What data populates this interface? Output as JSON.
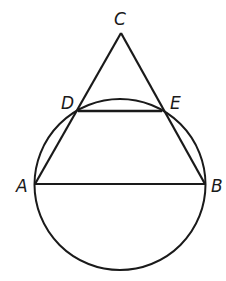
{
  "diagram": {
    "type": "geometry",
    "stroke_color": "#1a1a1a",
    "background": "#ffffff",
    "points": {
      "A": {
        "label": "A",
        "x": 35,
        "y": 184
      },
      "B": {
        "label": "B",
        "x": 205,
        "y": 184
      },
      "C": {
        "label": "C",
        "x": 121,
        "y": 33
      },
      "D": {
        "label": "D",
        "x": 78,
        "y": 111
      },
      "E": {
        "label": "E",
        "x": 162,
        "y": 111
      }
    },
    "circle": {
      "cx": 120,
      "cy": 184.5,
      "r": 85.5
    },
    "segments": [
      [
        "A",
        "C"
      ],
      [
        "B",
        "C"
      ],
      [
        "D",
        "E"
      ],
      [
        "A",
        "B"
      ]
    ]
  }
}
